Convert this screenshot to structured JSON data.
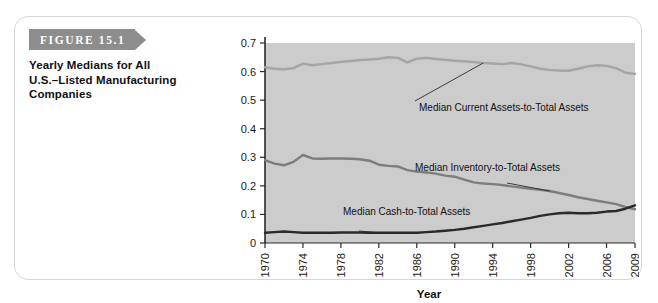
{
  "figure": {
    "label": "FIGURE 15.1",
    "caption_line_1": "Yearly Medians for All",
    "caption_line_2": "U.S.–Listed Manufacturing",
    "caption_line_3": "Companies",
    "banner_color": "#8d8d8d"
  },
  "chart_data": {
    "type": "line",
    "title": "Yearly Medians for All U.S.–Listed Manufacturing Companies",
    "xlabel": "Year",
    "ylabel": "",
    "xlim": [
      1970,
      2009
    ],
    "ylim": [
      0,
      0.7
    ],
    "grid": false,
    "legend_position": "inline-annotations",
    "plot_background": "#cccccc",
    "ytick_labels": [
      "0",
      "0.1",
      "0.2",
      "0.3",
      "0.4",
      "0.5",
      "0.6",
      "0.7"
    ],
    "ytick_values": [
      0,
      0.1,
      0.2,
      0.3,
      0.4,
      0.5,
      0.6,
      0.7
    ],
    "xtick_labels": [
      "1970",
      "1974",
      "1978",
      "1982",
      "1986",
      "1990",
      "1994",
      "1998",
      "2002",
      "2006",
      "2009"
    ],
    "xtick_values": [
      1970,
      1974,
      1978,
      1982,
      1986,
      1990,
      1994,
      1998,
      2002,
      2006,
      2009
    ],
    "x": [
      1970,
      1971,
      1972,
      1973,
      1974,
      1975,
      1976,
      1977,
      1978,
      1979,
      1980,
      1981,
      1982,
      1983,
      1984,
      1985,
      1986,
      1987,
      1988,
      1989,
      1990,
      1991,
      1992,
      1993,
      1994,
      1995,
      1996,
      1997,
      1998,
      1999,
      2000,
      2001,
      2002,
      2003,
      2004,
      2005,
      2006,
      2007,
      2008,
      2009
    ],
    "series": [
      {
        "name": "Median Current Assets-to-Total Assets",
        "color": "#a5a5a5",
        "values": [
          0.615,
          0.61,
          0.608,
          0.612,
          0.628,
          0.622,
          0.626,
          0.63,
          0.634,
          0.637,
          0.64,
          0.642,
          0.645,
          0.65,
          0.648,
          0.632,
          0.645,
          0.648,
          0.644,
          0.641,
          0.638,
          0.636,
          0.633,
          0.63,
          0.628,
          0.626,
          0.63,
          0.625,
          0.618,
          0.61,
          0.606,
          0.604,
          0.603,
          0.61,
          0.618,
          0.622,
          0.62,
          0.612,
          0.596,
          0.592
        ]
      },
      {
        "name": "Median Inventory-to-Total Assets",
        "color": "#7d7d7d",
        "values": [
          0.29,
          0.278,
          0.272,
          0.284,
          0.308,
          0.296,
          0.295,
          0.296,
          0.296,
          0.295,
          0.293,
          0.288,
          0.274,
          0.27,
          0.268,
          0.255,
          0.25,
          0.247,
          0.243,
          0.236,
          0.232,
          0.222,
          0.212,
          0.208,
          0.206,
          0.203,
          0.198,
          0.194,
          0.19,
          0.186,
          0.182,
          0.175,
          0.168,
          0.16,
          0.154,
          0.148,
          0.142,
          0.136,
          0.126,
          0.118
        ]
      },
      {
        "name": "Median Cash-to-Total Assets",
        "color": "#2a2a2a",
        "values": [
          0.036,
          0.038,
          0.04,
          0.038,
          0.036,
          0.036,
          0.036,
          0.036,
          0.037,
          0.037,
          0.037,
          0.036,
          0.036,
          0.036,
          0.036,
          0.036,
          0.036,
          0.038,
          0.04,
          0.043,
          0.046,
          0.05,
          0.055,
          0.06,
          0.065,
          0.07,
          0.076,
          0.082,
          0.088,
          0.095,
          0.1,
          0.104,
          0.106,
          0.104,
          0.104,
          0.106,
          0.11,
          0.112,
          0.12,
          0.132
        ]
      }
    ],
    "annotations": [
      {
        "text": "Median Current Assets-to-Total Assets",
        "target_year": 1993,
        "target_value": 0.63
      },
      {
        "text": "Median Inventory-to-Total Assets",
        "target_year": 2000,
        "target_value": 0.182
      },
      {
        "text": "Median Cash-to-Total Assets",
        "target_year": 1982,
        "target_value": 0.036
      }
    ]
  }
}
